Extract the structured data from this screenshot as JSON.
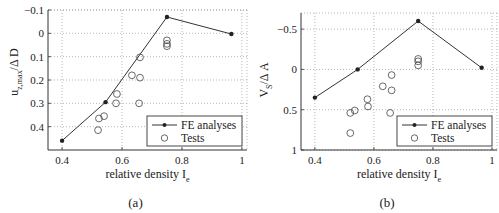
{
  "chart_data": [
    {
      "id": "a",
      "type": "scatter",
      "caption": "(a)",
      "title": "",
      "xlabel": "relative density I",
      "xlabel_sub": "e",
      "ylabel": "u",
      "ylabel_sub": "z,max",
      "ylabel_suffix": "/Δ D",
      "xlim": [
        0.353,
        1.017
      ],
      "ylim": [
        -0.1,
        0.5
      ],
      "y_reversed": true,
      "xticks": [
        0.4,
        0.6,
        0.8,
        1
      ],
      "xtick_labels": [
        "0.4",
        "0.6",
        "0.8",
        "1"
      ],
      "yticks": [
        -0.1,
        0,
        0.1,
        0.2,
        0.3,
        0.4
      ],
      "ytick_labels": [
        "-0.1",
        "0",
        "0.1",
        "0.2",
        "0.3",
        "0.4"
      ],
      "grid": true,
      "legend_position": "lower right",
      "series": [
        {
          "name": "FE analyses",
          "style": "line-star",
          "x": [
            0.4,
            0.545,
            0.75,
            0.965
          ],
          "y": [
            0.46,
            0.295,
            -0.07,
            0.003
          ]
        },
        {
          "name": "Tests",
          "style": "circle",
          "x": [
            0.66,
            0.633,
            0.66,
            0.583,
            0.58,
            0.657,
            0.523,
            0.54,
            0.52,
            0.75,
            0.75,
            0.75
          ],
          "y": [
            0.103,
            0.18,
            0.19,
            0.26,
            0.3,
            0.3,
            0.365,
            0.355,
            0.415,
            0.03,
            0.045,
            0.055
          ]
        }
      ]
    },
    {
      "id": "b",
      "type": "scatter",
      "caption": "(b)",
      "title": "",
      "xlabel": "relative density I",
      "xlabel_sub": "e",
      "ylabel": "V",
      "ylabel_sub": "S",
      "ylabel_suffix": "/Δ A",
      "xlim": [
        0.353,
        1.017
      ],
      "ylim": [
        -0.7,
        1.0
      ],
      "y_reversed": true,
      "xticks": [
        0.4,
        0.6,
        0.8,
        1
      ],
      "xtick_labels": [
        "0.4",
        "0.6",
        "0.8",
        "1"
      ],
      "yticks": [
        -0.5,
        0,
        0.5,
        1
      ],
      "ytick_labels": [
        "-0.5",
        "0",
        "0.5",
        "1"
      ],
      "grid": true,
      "legend_position": "lower right",
      "series": [
        {
          "name": "FE analyses",
          "style": "line-star",
          "x": [
            0.4,
            0.545,
            0.75,
            0.965
          ],
          "y": [
            0.35,
            0.0,
            -0.6,
            -0.02
          ]
        },
        {
          "name": "Tests",
          "style": "circle",
          "x": [
            0.52,
            0.535,
            0.578,
            0.58,
            0.63,
            0.66,
            0.66,
            0.655,
            0.52,
            0.75,
            0.75,
            0.75
          ],
          "y": [
            0.54,
            0.51,
            0.37,
            0.46,
            0.21,
            0.07,
            0.26,
            0.54,
            0.79,
            -0.13,
            -0.1,
            -0.05
          ]
        }
      ]
    }
  ],
  "legend": {
    "fe_label": "FE analyses",
    "tests_label": "Tests"
  }
}
